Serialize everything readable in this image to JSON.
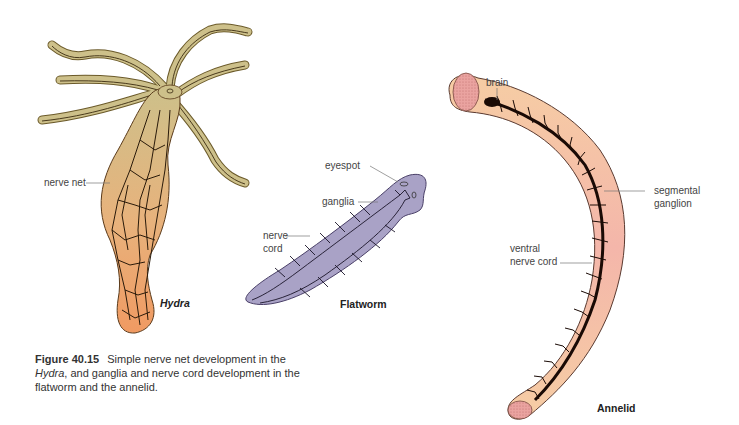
{
  "figure": {
    "number": "Figure 40.15",
    "caption_parts": {
      "p1": "Simple nerve net development in the ",
      "p2": "Hydra",
      "p3": ", and ganglia and nerve cord development in the flatworm and the annelid."
    }
  },
  "organisms": {
    "hydra": {
      "name": "Hydra",
      "labels": {
        "nerve_net": "nerve net"
      }
    },
    "flatworm": {
      "name": "Flatworm",
      "labels": {
        "eyespot": "eyespot",
        "ganglia": "ganglia",
        "nerve_cord_1": "nerve",
        "nerve_cord_2": "cord"
      }
    },
    "annelid": {
      "name": "Annelid",
      "labels": {
        "brain": "brain",
        "segmental_1": "segmental",
        "segmental_2": "ganglion",
        "ventral_1": "ventral",
        "ventral_2": "nerve cord"
      }
    }
  },
  "colors": {
    "hydra_top": "#c9bd82",
    "hydra_bottom": "#f0a06a",
    "flatworm": "#a9a2c6",
    "annelid_top": "#f5c9a0",
    "annelid_mid": "#f3b3a8",
    "annelid_brain": "#e8a0a0",
    "nerve": "#2a1a10"
  }
}
